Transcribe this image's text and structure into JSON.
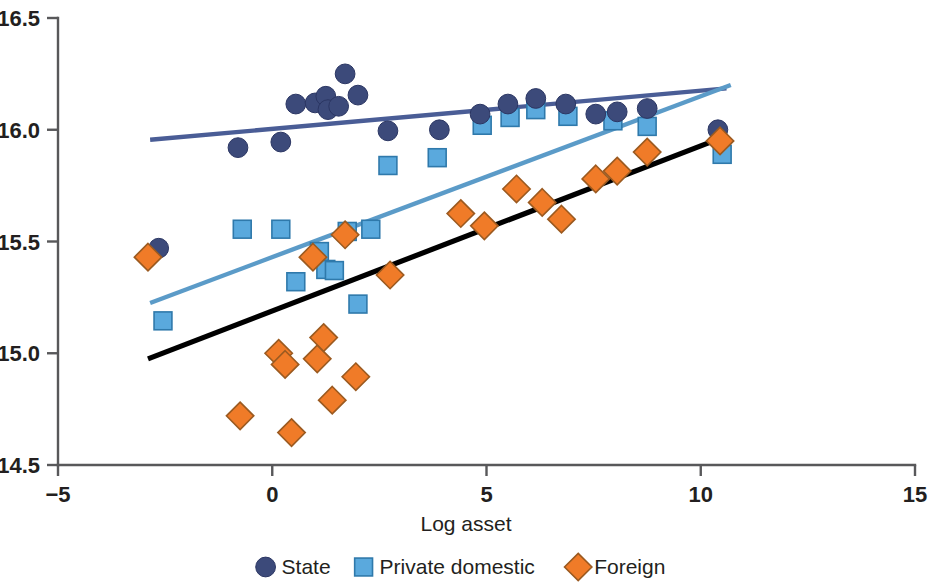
{
  "chart_data": {
    "type": "scatter",
    "title": "",
    "xlabel": "Log asset",
    "ylabel": "",
    "xlim": [
      -5,
      15
    ],
    "ylim": [
      14.5,
      16.5
    ],
    "xticks": [
      -5,
      0,
      5,
      10,
      15
    ],
    "xtick_labels": [
      "−5",
      "0",
      "5",
      "10",
      "15"
    ],
    "yticks": [
      14.5,
      15.0,
      15.5,
      16.0,
      16.5
    ],
    "ytick_labels": [
      "14.5",
      "15.0",
      "15.5",
      "16.0",
      "16.5"
    ],
    "grid": false,
    "legend_position": "bottom",
    "colors": {
      "state": "#3c4a7a",
      "private_domestic": "#5aa9dd",
      "foreign": "#f07b28",
      "state_trend": "#4a5d96",
      "private_trend": "#5b9bc8",
      "foreign_trend": "#000000",
      "axis": "#58585a",
      "text": "#231f20",
      "background": "#ffffff"
    },
    "series": [
      {
        "name": "State",
        "marker": "circle",
        "color": "#3c4a7a",
        "points": [
          [
            -2.65,
            15.47
          ],
          [
            -0.8,
            15.92
          ],
          [
            0.2,
            15.945
          ],
          [
            0.55,
            16.115
          ],
          [
            1.0,
            16.12
          ],
          [
            1.25,
            16.15
          ],
          [
            1.3,
            16.09
          ],
          [
            1.55,
            16.105
          ],
          [
            1.7,
            16.25
          ],
          [
            2.0,
            16.155
          ],
          [
            2.7,
            15.995
          ],
          [
            3.9,
            16.0
          ],
          [
            4.85,
            16.07
          ],
          [
            5.5,
            16.115
          ],
          [
            6.15,
            16.14
          ],
          [
            6.85,
            16.115
          ],
          [
            7.55,
            16.07
          ],
          [
            8.05,
            16.08
          ],
          [
            8.75,
            16.095
          ],
          [
            10.4,
            16.0
          ]
        ]
      },
      {
        "name": "Private domestic",
        "marker": "square",
        "color": "#5aa9dd",
        "points": [
          [
            -2.55,
            15.145
          ],
          [
            -0.7,
            15.555
          ],
          [
            0.2,
            15.555
          ],
          [
            0.55,
            15.32
          ],
          [
            1.1,
            15.455
          ],
          [
            1.25,
            15.375
          ],
          [
            1.45,
            15.37
          ],
          [
            1.75,
            15.545
          ],
          [
            2.0,
            15.22
          ],
          [
            2.3,
            15.555
          ],
          [
            2.7,
            15.84
          ],
          [
            3.85,
            15.875
          ],
          [
            4.9,
            16.02
          ],
          [
            5.55,
            16.055
          ],
          [
            6.15,
            16.09
          ],
          [
            6.9,
            16.06
          ],
          [
            7.95,
            16.04
          ],
          [
            8.75,
            16.015
          ],
          [
            10.5,
            15.89
          ]
        ]
      },
      {
        "name": "Foreign",
        "marker": "diamond",
        "color": "#f07b28",
        "points": [
          [
            -2.9,
            15.43
          ],
          [
            -0.75,
            14.72
          ],
          [
            0.15,
            15.0
          ],
          [
            0.3,
            14.95
          ],
          [
            0.45,
            14.645
          ],
          [
            0.95,
            15.43
          ],
          [
            1.05,
            14.975
          ],
          [
            1.2,
            15.07
          ],
          [
            1.4,
            14.79
          ],
          [
            1.7,
            15.53
          ],
          [
            1.95,
            14.895
          ],
          [
            2.75,
            15.35
          ],
          [
            4.4,
            15.625
          ],
          [
            4.95,
            15.57
          ],
          [
            5.7,
            15.735
          ],
          [
            6.3,
            15.675
          ],
          [
            6.75,
            15.6
          ],
          [
            7.55,
            15.78
          ],
          [
            8.05,
            15.815
          ],
          [
            8.75,
            15.9
          ],
          [
            10.45,
            15.95
          ]
        ]
      }
    ],
    "trend_lines": [
      {
        "name": "State trend",
        "color": "#4a5d96",
        "x0": -2.85,
        "y0": 15.955,
        "x1": 10.6,
        "y1": 16.185
      },
      {
        "name": "Private domestic trend",
        "color": "#5b9bc8",
        "x0": -2.85,
        "y0": 15.225,
        "x1": 10.7,
        "y1": 16.2
      },
      {
        "name": "Foreign trend",
        "color": "#000000",
        "x0": -2.9,
        "y0": 14.975,
        "x1": 10.5,
        "y1": 15.965
      }
    ],
    "legend": [
      {
        "label": "State",
        "marker": "circle",
        "color": "#3c4a7a"
      },
      {
        "label": "Private domestic",
        "marker": "square",
        "color": "#5aa9dd"
      },
      {
        "label": "Foreign",
        "marker": "diamond",
        "color": "#f07b28"
      }
    ]
  }
}
